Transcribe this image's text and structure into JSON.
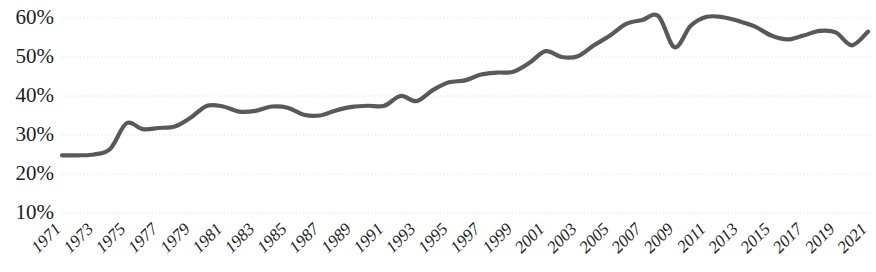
{
  "chart_data": {
    "type": "line",
    "title": "",
    "subtitle": "",
    "xlabel": "",
    "ylabel": "",
    "grid": true,
    "grid_axis": "y",
    "legend": false,
    "legend_position": "none",
    "line_color": "#595959",
    "grid_color": "#d9d9d9",
    "text_color": "#1d1d1d",
    "background_color": "#ffffff",
    "ylim": [
      5,
      65
    ],
    "ytick_values": [
      10,
      20,
      30,
      40,
      50,
      60
    ],
    "ytick_labels": [
      "10%",
      "20%",
      "30%",
      "40%",
      "50%",
      "60%"
    ],
    "xlim": [
      1971,
      2021
    ],
    "xtick_labels": [
      "1971",
      "1973",
      "1975",
      "1977",
      "1979",
      "1981",
      "1983",
      "1985",
      "1987",
      "1989",
      "1991",
      "1993",
      "1995",
      "1997",
      "1999",
      "2001",
      "2003",
      "2005",
      "2007",
      "2009",
      "2011",
      "2013",
      "2015",
      "2017",
      "2019",
      "2021"
    ],
    "xtick_values": [
      1971,
      1973,
      1975,
      1977,
      1979,
      1981,
      1983,
      1985,
      1987,
      1989,
      1991,
      1993,
      1995,
      1997,
      1999,
      2001,
      2003,
      2005,
      2007,
      2009,
      2011,
      2013,
      2015,
      2017,
      2019,
      2021
    ],
    "xtick_rotation": 45,
    "series": [
      {
        "name": "",
        "x": [
          1971,
          1972,
          1973,
          1974,
          1975,
          1976,
          1977,
          1978,
          1979,
          1980,
          1981,
          1982,
          1983,
          1984,
          1985,
          1986,
          1987,
          1988,
          1989,
          1990,
          1991,
          1992,
          1993,
          1994,
          1995,
          1996,
          1997,
          1998,
          1999,
          2000,
          2001,
          2002,
          2003,
          2004,
          2005,
          2006,
          2007,
          2008,
          2009,
          2010,
          2011,
          2012,
          2013,
          2014,
          2015,
          2016,
          2017,
          2018,
          2019,
          2020,
          2021
        ],
        "values": [
          24.8,
          24.8,
          25.0,
          26.5,
          33.0,
          31.5,
          31.8,
          32.2,
          34.5,
          37.5,
          37.3,
          36.0,
          36.2,
          37.3,
          37.0,
          35.2,
          35.0,
          36.3,
          37.2,
          37.5,
          37.5,
          40.0,
          38.7,
          41.5,
          43.5,
          44.0,
          45.5,
          46.0,
          46.2,
          48.5,
          51.5,
          50.0,
          50.2,
          53.0,
          55.5,
          58.5,
          59.5,
          60.5,
          52.5,
          58.0,
          60.3,
          60.2,
          59.2,
          57.8,
          55.5,
          54.5,
          55.5,
          56.7,
          56.3,
          53.0,
          56.5
        ]
      }
    ]
  }
}
